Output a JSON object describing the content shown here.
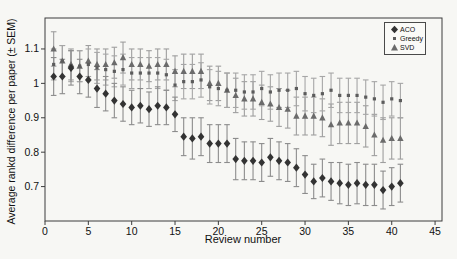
{
  "figure": {
    "background": "#f7f7f4"
  },
  "legend": {
    "position": "upper right",
    "items": [
      {
        "label": "ACO",
        "marker": "diamond"
      },
      {
        "label": "Greedy",
        "marker": "square"
      },
      {
        "label": "SVD",
        "marker": "triangle"
      }
    ]
  },
  "chart_data": {
    "type": "scatter",
    "title": "",
    "xlabel": "Review number",
    "ylabel": "Average rankd difference per paper (± SEM)",
    "grid": false,
    "legend_position": "upper right",
    "xlim": [
      0,
      45.8
    ],
    "ylim": [
      0.6,
      1.19
    ],
    "xticks": [
      0,
      5,
      10,
      15,
      20,
      25,
      30,
      35,
      40,
      45
    ],
    "yticks": [
      {
        "v": 0.7,
        "label": "0.7"
      },
      {
        "v": 0.8,
        "label": "0.8"
      },
      {
        "v": 0.9,
        "label": "0.9"
      },
      {
        "v": 1.0,
        "label": "1"
      },
      {
        "v": 1.1,
        "label": "1.1"
      }
    ],
    "x": [
      1,
      2,
      3,
      4,
      5,
      6,
      7,
      8,
      9,
      10,
      11,
      12,
      13,
      14,
      15,
      16,
      17,
      18,
      19,
      20,
      21,
      22,
      23,
      24,
      25,
      26,
      27,
      28,
      29,
      30,
      31,
      32,
      33,
      34,
      35,
      36,
      37,
      38,
      39,
      40,
      41
    ],
    "series": [
      {
        "name": "SVD",
        "marker": "triangle",
        "marker_color": "#6b6b6b",
        "bar_color": "#9e9e9e",
        "values": [
          1.1,
          1.065,
          1.055,
          1.05,
          1.065,
          1.055,
          1.055,
          1.06,
          1.075,
          1.055,
          1.055,
          1.05,
          1.055,
          1.055,
          1.035,
          1.035,
          1.035,
          1.035,
          1.0,
          1.0,
          0.98,
          0.965,
          0.955,
          0.955,
          0.945,
          0.94,
          0.93,
          0.925,
          0.905,
          0.905,
          0.905,
          0.9,
          0.88,
          0.885,
          0.885,
          0.885,
          0.875,
          0.85,
          0.835,
          0.84,
          0.84
        ],
        "sem": [
          0.05,
          0.045,
          0.045,
          0.045,
          0.045,
          0.045,
          0.045,
          0.045,
          0.045,
          0.045,
          0.045,
          0.045,
          0.045,
          0.045,
          0.045,
          0.05,
          0.05,
          0.05,
          0.05,
          0.05,
          0.05,
          0.05,
          0.05,
          0.05,
          0.05,
          0.05,
          0.055,
          0.055,
          0.055,
          0.055,
          0.055,
          0.055,
          0.06,
          0.06,
          0.06,
          0.06,
          0.06,
          0.06,
          0.065,
          0.06,
          0.06
        ]
      },
      {
        "name": "Greedy",
        "marker": "square",
        "marker_color": "#5c5c5c",
        "bar_color": "#a6a6a6",
        "values": [
          1.055,
          1.065,
          1.05,
          1.05,
          1.055,
          1.045,
          1.04,
          1.035,
          1.04,
          1.03,
          1.03,
          1.03,
          1.03,
          1.025,
          0.995,
          1.005,
          1.005,
          1.01,
          0.99,
          0.985,
          0.98,
          0.98,
          0.975,
          0.975,
          0.985,
          0.975,
          0.98,
          0.98,
          0.985,
          0.97,
          0.965,
          0.97,
          0.98,
          0.965,
          0.965,
          0.965,
          0.96,
          0.955,
          0.945,
          0.955,
          0.95
        ],
        "sem": [
          0.045,
          0.045,
          0.045,
          0.045,
          0.045,
          0.045,
          0.045,
          0.045,
          0.045,
          0.045,
          0.045,
          0.045,
          0.045,
          0.045,
          0.045,
          0.05,
          0.05,
          0.05,
          0.05,
          0.05,
          0.05,
          0.05,
          0.05,
          0.05,
          0.05,
          0.05,
          0.05,
          0.05,
          0.05,
          0.05,
          0.05,
          0.05,
          0.05,
          0.05,
          0.05,
          0.05,
          0.05,
          0.05,
          0.05,
          0.05,
          0.05
        ]
      },
      {
        "name": "ACO",
        "marker": "diamond",
        "marker_color": "#333333",
        "bar_color": "#8c8c8c",
        "values": [
          1.02,
          1.02,
          1.045,
          1.02,
          1.01,
          0.985,
          0.97,
          0.95,
          0.94,
          0.93,
          0.935,
          0.925,
          0.935,
          0.93,
          0.91,
          0.845,
          0.84,
          0.845,
          0.825,
          0.825,
          0.825,
          0.78,
          0.775,
          0.775,
          0.77,
          0.785,
          0.775,
          0.77,
          0.755,
          0.735,
          0.715,
          0.725,
          0.715,
          0.71,
          0.705,
          0.71,
          0.705,
          0.705,
          0.69,
          0.7,
          0.71
        ],
        "sem": [
          0.055,
          0.05,
          0.05,
          0.05,
          0.05,
          0.055,
          0.05,
          0.05,
          0.05,
          0.05,
          0.05,
          0.05,
          0.055,
          0.05,
          0.05,
          0.055,
          0.06,
          0.055,
          0.055,
          0.055,
          0.055,
          0.06,
          0.055,
          0.055,
          0.055,
          0.055,
          0.055,
          0.055,
          0.055,
          0.055,
          0.05,
          0.055,
          0.055,
          0.06,
          0.06,
          0.06,
          0.06,
          0.06,
          0.055,
          0.055,
          0.055
        ]
      }
    ]
  }
}
